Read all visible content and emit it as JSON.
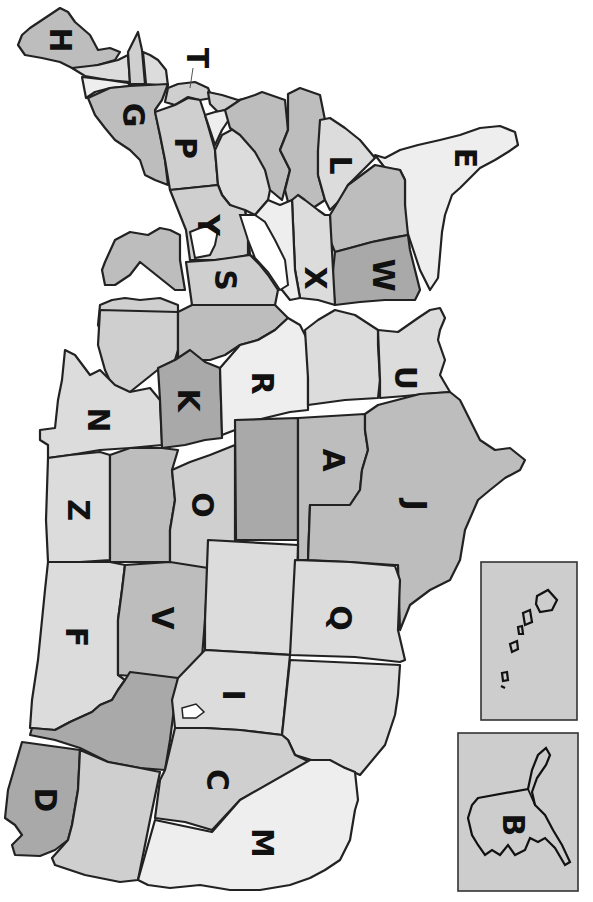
{
  "map": {
    "title": "United States map (rotated, north to the left) with lettered states",
    "orientation": "rotated 90 degrees clockwise",
    "colors": {
      "dark": "#a9a9a9",
      "mid": "#bdbdbd",
      "light": "#cfcfcf",
      "lighter": "#dcdcdc",
      "lightest": "#eeeeee",
      "border": "#222222",
      "inset_bg": "#cdcdcd"
    },
    "labels": [
      {
        "letter": "H",
        "x": 60,
        "y": 40
      },
      {
        "letter": "T",
        "x": 197,
        "y": 58
      },
      {
        "letter": "G",
        "x": 133,
        "y": 115
      },
      {
        "letter": "P",
        "x": 185,
        "y": 148
      },
      {
        "letter": "Y",
        "x": 208,
        "y": 225
      },
      {
        "letter": "S",
        "x": 225,
        "y": 280
      },
      {
        "letter": "L",
        "x": 340,
        "y": 165
      },
      {
        "letter": "E",
        "x": 465,
        "y": 158
      },
      {
        "letter": "X",
        "x": 315,
        "y": 278
      },
      {
        "letter": "W",
        "x": 383,
        "y": 275
      },
      {
        "letter": "N",
        "x": 98,
        "y": 420
      },
      {
        "letter": "K",
        "x": 188,
        "y": 400
      },
      {
        "letter": "R",
        "x": 262,
        "y": 383
      },
      {
        "letter": "U",
        "x": 405,
        "y": 378
      },
      {
        "letter": "A",
        "x": 333,
        "y": 460
      },
      {
        "letter": "J",
        "x": 415,
        "y": 505
      },
      {
        "letter": "Z",
        "x": 78,
        "y": 510
      },
      {
        "letter": "O",
        "x": 202,
        "y": 505
      },
      {
        "letter": "F",
        "x": 76,
        "y": 637
      },
      {
        "letter": "V",
        "x": 162,
        "y": 618
      },
      {
        "letter": "Q",
        "x": 340,
        "y": 618
      },
      {
        "letter": "I",
        "x": 233,
        "y": 695
      },
      {
        "letter": "C",
        "x": 217,
        "y": 780
      },
      {
        "letter": "D",
        "x": 45,
        "y": 800
      },
      {
        "letter": "M",
        "x": 262,
        "y": 843
      },
      {
        "letter": "B",
        "x": 513,
        "y": 825
      }
    ],
    "insets": [
      {
        "name": "hawaii-inset",
        "x": 481,
        "y": 562,
        "width": 96,
        "height": 158,
        "label": ""
      },
      {
        "name": "alaska-inset",
        "x": 458,
        "y": 733,
        "width": 120,
        "height": 158,
        "label": "B"
      }
    ]
  }
}
